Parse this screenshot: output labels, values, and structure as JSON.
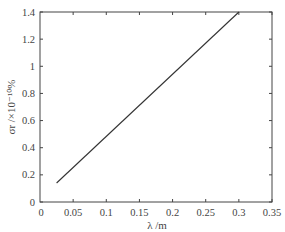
{
  "chart_data": {
    "type": "line",
    "title": "",
    "xlabel": "λ /m",
    "ylabel": "σr /×10⁻¹⁰%",
    "xlim": [
      0,
      0.35
    ],
    "ylim": [
      0,
      1.4
    ],
    "xticks": [
      0.05,
      0.1,
      0.15,
      0.2,
      0.25,
      0.3,
      0.35
    ],
    "xtick_labels": [
      "0.05",
      "0.1",
      "0.15",
      "0.2",
      "0.25",
      "0.3",
      "0.35"
    ],
    "yticks": [
      0,
      0.2,
      0.4,
      0.6,
      0.8,
      1,
      1.2,
      1.4
    ],
    "ytick_labels": [
      "0",
      "0.2",
      "0.4",
      "0.6",
      "0.8",
      "1",
      "1.2",
      "1.4"
    ],
    "x_origin_label": "0",
    "grid": false,
    "legend": null,
    "series": [
      {
        "name": "σr",
        "color": "#333333",
        "x": [
          0.025,
          0.3
        ],
        "y": [
          0.14,
          1.4
        ]
      }
    ]
  }
}
